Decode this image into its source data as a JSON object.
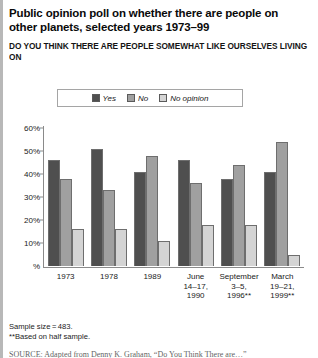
{
  "title": "Public opinion poll on whether there are people on other planets, selected years 1973–99",
  "subtitle_line1": "DO YOU THINK THERE ARE PEOPLE SOMEWHAT LIKE OURSELVES LIVING ON",
  "subtitle_line2": "OTHER PLANETS IN THE UNIVERSE OR NOT?",
  "notes": {
    "sample_size": "Sample size = 483.",
    "half_sample": "**Based on half sample."
  },
  "source": "SOURCE: Adapted from Denny K. Graham, “Do You Think There are…”",
  "colors": {
    "yes": "#4f4f4f",
    "no": "#a0a0a0",
    "no_opinion": "#d4d4d4",
    "axis": "#8a8a8a",
    "bar_outline": "#6e6e6e"
  },
  "chart_data": {
    "type": "bar",
    "title": "Public opinion poll on whether there are people on other planets, selected years 1973–99",
    "subtitle": "DO YOU THINK THERE ARE PEOPLE SOMEWHAT LIKE OURSELVES LIVING ON OTHER PLANETS IN THE UNIVERSE OR NOT?",
    "xlabel": "",
    "ylabel": "%",
    "ylim": [
      0,
      60
    ],
    "yticks": [
      0,
      10,
      20,
      30,
      40,
      50,
      60
    ],
    "ytick_labels": [
      "%",
      "10%",
      "20%",
      "30%",
      "40%",
      "50%",
      "60%"
    ],
    "grid": false,
    "legend_position": "top-center",
    "categories": [
      "1973",
      "1978",
      "1989",
      "June\n14–17,\n1990",
      "September\n3–5,\n1996**",
      "March\n19–21,\n1999**"
    ],
    "series": [
      {
        "name": "Yes",
        "color": "#4f4f4f",
        "values": [
          46,
          51,
          41,
          46,
          38,
          41
        ]
      },
      {
        "name": "No",
        "color": "#a0a0a0",
        "values": [
          38,
          33,
          48,
          36,
          44,
          54
        ]
      },
      {
        "name": "No opinion",
        "color": "#d4d4d4",
        "values": [
          16,
          16,
          11,
          18,
          18,
          5
        ]
      }
    ]
  }
}
